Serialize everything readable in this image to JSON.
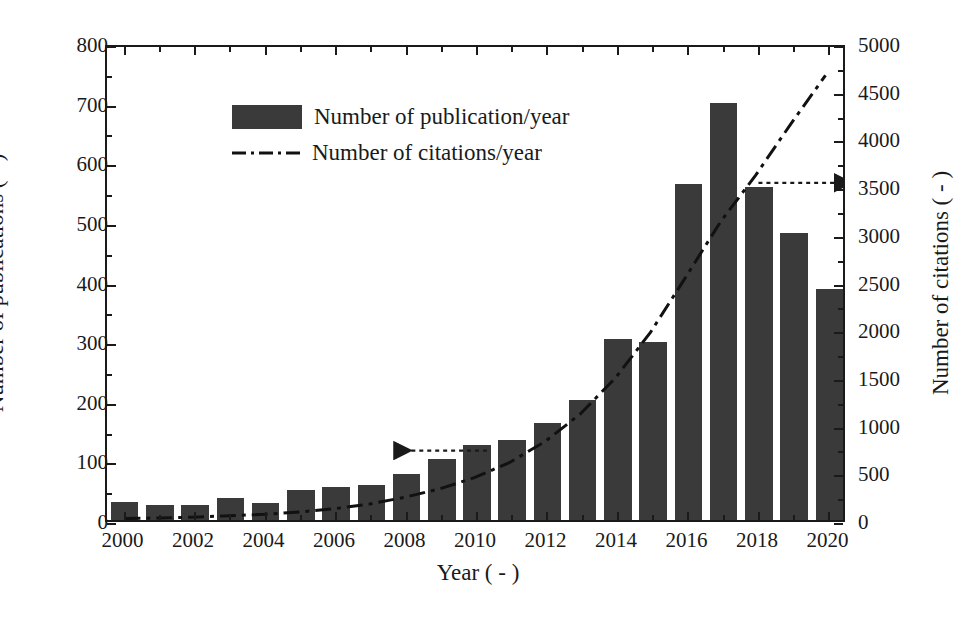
{
  "chart_data": {
    "type": "bar",
    "title": "",
    "xlabel": "Year ( - )",
    "ylabel": "Number of publications ( - )",
    "ylabel_right": "Number of citations ( - )",
    "grid": false,
    "legend_position": "top-left",
    "xlim": [
      1999.5,
      2020.5
    ],
    "ylim": [
      0,
      800
    ],
    "ylim_right": [
      0,
      5000
    ],
    "ytick_step": 100,
    "ytick_step_right": 500,
    "xtick_step": 2,
    "categories": [
      2000,
      2001,
      2002,
      2003,
      2004,
      2005,
      2006,
      2007,
      2008,
      2009,
      2010,
      2011,
      2012,
      2013,
      2014,
      2015,
      2016,
      2017,
      2018,
      2019,
      2020
    ],
    "xticklabels": [
      "2000",
      "2002",
      "2004",
      "2006",
      "2008",
      "2010",
      "2012",
      "2014",
      "2016",
      "2018",
      "2020"
    ],
    "yticklabels": [
      "0",
      "100",
      "200",
      "300",
      "400",
      "500",
      "600",
      "700",
      "800"
    ],
    "yticklabels_right": [
      "0",
      "500",
      "1000",
      "1500",
      "2000",
      "2500",
      "3000",
      "3500",
      "4000",
      "4500",
      "5000"
    ],
    "series": [
      {
        "name": "Number of publication/year",
        "type": "bar",
        "axis": "left",
        "color": "#3a3a3a",
        "values": [
          30,
          25,
          25,
          37,
          28,
          51,
          55,
          59,
          78,
          103,
          126,
          135,
          163,
          202,
          304,
          299,
          563,
          699,
          558,
          482,
          388
        ]
      },
      {
        "name": "Number of citations/year",
        "type": "line",
        "axis": "right",
        "linestyle": "dash-dot",
        "color": "#111111",
        "values": [
          15,
          22,
          30,
          45,
          60,
          85,
          120,
          170,
          240,
          330,
          450,
          610,
          830,
          1120,
          1500,
          1980,
          2560,
          3150,
          3640,
          4180,
          4700
        ]
      }
    ],
    "annotations": [
      {
        "name": "left-axis-arrow",
        "label": "",
        "direction": "left",
        "x_year": 2007.0,
        "y_value": 118
      },
      {
        "name": "right-axis-arrow",
        "label": "",
        "direction": "right",
        "x_year": 2019.2,
        "y_value_right": 3750
      }
    ]
  },
  "legend": {
    "items": [
      {
        "label": "Number of publication/year",
        "marker": "filled-square"
      },
      {
        "label": "Number of citations/year",
        "marker": "dash-dot-line"
      }
    ]
  },
  "colors": {
    "bar": "#3a3a3a",
    "line": "#111111",
    "axis": "#1a1a1a",
    "background": "#ffffff"
  }
}
